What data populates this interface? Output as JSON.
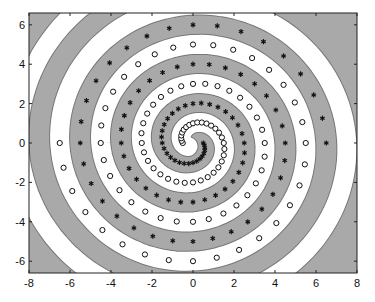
{
  "chart_data": {
    "type": "scatter",
    "title": "",
    "xlabel": "",
    "ylabel": "",
    "xlim": [
      -8,
      8
    ],
    "ylim": [
      -6.6,
      6.6
    ],
    "xticks": [
      -8,
      -6,
      -4,
      -2,
      0,
      2,
      4,
      6,
      8
    ],
    "yticks": [
      -6,
      -4,
      -2,
      0,
      2,
      4,
      6
    ],
    "grid": false,
    "legend": null,
    "series": [
      {
        "name": "asterisk-class",
        "marker": "asterisk",
        "generator": {
          "formula": "r = theta/pi; x = r*sin(theta); y = r*cos(theta)",
          "theta_start_pi": 0.5,
          "theta_end_pi": 6.5,
          "theta_step_pi": 0.0625,
          "sign": 1
        },
        "sample_points": [
          [
            0.5,
            0
          ],
          [
            0,
            -1
          ],
          [
            -1.5,
            0
          ],
          [
            0,
            2
          ],
          [
            2.5,
            0
          ],
          [
            0,
            -3
          ],
          [
            -3.5,
            0
          ],
          [
            0,
            4
          ],
          [
            4.5,
            0
          ],
          [
            0,
            -5
          ],
          [
            -5.5,
            0
          ],
          [
            0,
            6
          ],
          [
            6.5,
            0
          ]
        ]
      },
      {
        "name": "circle-class",
        "marker": "circle",
        "generator": {
          "formula": "r = theta/pi; x = -r*sin(theta); y = -r*cos(theta)",
          "theta_start_pi": 0.5,
          "theta_end_pi": 6.5,
          "theta_step_pi": 0.0625,
          "sign": -1
        },
        "sample_points": [
          [
            -0.5,
            0
          ],
          [
            0,
            1
          ],
          [
            1.5,
            0
          ],
          [
            0,
            -2
          ],
          [
            -2.5,
            0
          ],
          [
            0,
            3
          ],
          [
            3.5,
            0
          ],
          [
            0,
            -4
          ],
          [
            -4.5,
            0
          ],
          [
            0,
            5
          ],
          [
            5.5,
            0
          ],
          [
            0,
            -6
          ],
          [
            -6.5,
            0
          ]
        ]
      }
    ],
    "regions": {
      "gray": "#a9a9a9",
      "white": "#ffffff",
      "boundary": "#777777"
    }
  },
  "style": {
    "marker_color": "#111111",
    "axis_color": "#222222"
  }
}
